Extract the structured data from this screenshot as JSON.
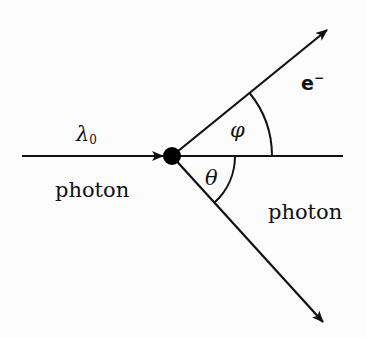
{
  "figure": {
    "type": "compton-scattering-diagram",
    "background": "#fcfcfc",
    "line_color": "#111111",
    "vertex": {
      "x": 172,
      "y": 156,
      "radius": 9
    },
    "incident_photon": {
      "label": "photon",
      "wavelength_symbol": "λ",
      "wavelength_subscript": "0"
    },
    "scattered_electron": {
      "symbol": "e",
      "charge": "−",
      "angle_symbol": "φ"
    },
    "scattered_photon": {
      "label": "photon",
      "angle_symbol": "θ"
    },
    "lines": {
      "incident": {
        "x1": 22,
        "y1": 156,
        "x2": 163,
        "y2": 156
      },
      "baseline": {
        "x1": 172,
        "y1": 156,
        "x2": 343,
        "y2": 156
      },
      "electron": {
        "x1": 172,
        "y1": 156,
        "x2": 327,
        "y2": 30
      },
      "photon_out": {
        "x1": 172,
        "y1": 156,
        "x2": 323,
        "y2": 322
      }
    },
    "arcs": {
      "phi_radius": 100,
      "theta_radius": 63
    }
  }
}
